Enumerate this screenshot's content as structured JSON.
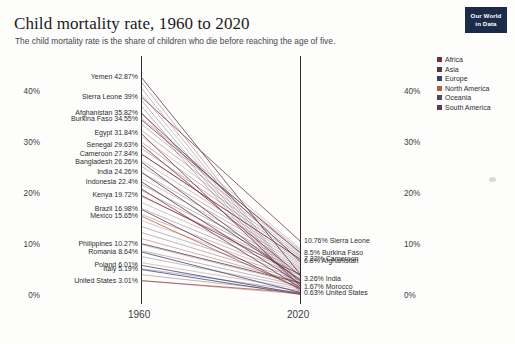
{
  "header": {
    "title": "Child mortality rate, 1960 to 2020",
    "subtitle": "The child mortality rate is the share of children who die before reaching the age of five."
  },
  "logo": {
    "line1": "Our World",
    "line2": "in Data"
  },
  "axes": {
    "y_ticks": [
      "40%",
      "30%",
      "20%",
      "10%",
      "0%"
    ],
    "x_ticks": [
      "1960",
      "2020"
    ]
  },
  "legend": {
    "items": [
      {
        "label": "Africa",
        "color": "#7a2c3a"
      },
      {
        "label": "Asia",
        "color": "#5b3242"
      },
      {
        "label": "Europe",
        "color": "#3b3f6e"
      },
      {
        "label": "North America",
        "color": "#b4594a"
      },
      {
        "label": "Oceania",
        "color": "#4a4a66"
      },
      {
        "label": "South America",
        "color": "#6e3550"
      }
    ]
  },
  "left_labels": [
    {
      "text": "Yemen 42.87%",
      "value": 42.87
    },
    {
      "text": "Sierra Leone 39%",
      "value": 39.0
    },
    {
      "text": "Afghanistan 35.82%",
      "value": 35.82
    },
    {
      "text": "Burkina Faso 34.55%",
      "value": 34.55
    },
    {
      "text": "Egypt 31.84%",
      "value": 31.84
    },
    {
      "text": "Senegal 29.63%",
      "value": 29.63
    },
    {
      "text": "Cameroon 27.84%",
      "value": 27.84
    },
    {
      "text": "Bangladesh 26.26%",
      "value": 26.26
    },
    {
      "text": "India 24.26%",
      "value": 24.26
    },
    {
      "text": "Indonesia 22.4%",
      "value": 22.4
    },
    {
      "text": "Kenya 19.72%",
      "value": 19.72
    },
    {
      "text": "Brazil 16.98%",
      "value": 16.98
    },
    {
      "text": "Mexico 15.65%",
      "value": 15.65
    },
    {
      "text": "Philippines 10.27%",
      "value": 10.27
    },
    {
      "text": "Romania 8.64%",
      "value": 8.64
    },
    {
      "text": "Poland 6.01%",
      "value": 6.01
    },
    {
      "text": "Italy 5.19%",
      "value": 5.19
    },
    {
      "text": "United States 3.01%",
      "value": 3.01
    }
  ],
  "right_labels": [
    {
      "text": "10.76% Sierra Leone",
      "value": 10.76
    },
    {
      "text": "8.5% Burkina Faso",
      "value": 8.5
    },
    {
      "text": "7.22% Cameroon",
      "value": 7.22
    },
    {
      "text": "6.8% Afghanistan",
      "value": 6.8
    },
    {
      "text": "3.26% India",
      "value": 3.26
    },
    {
      "text": "1.67% Morocco",
      "value": 1.67
    },
    {
      "text": "0.63% United States",
      "value": 0.63
    }
  ],
  "chart_data": {
    "type": "line",
    "title": "Child mortality rate, 1960 to 2020",
    "subtitle": "The child mortality rate is the share of children who die before reaching the age of five.",
    "xlabel": "",
    "ylabel": "",
    "x": [
      1960,
      2020
    ],
    "ylim": [
      0,
      45
    ],
    "xlim": [
      1960,
      2020
    ],
    "grid": false,
    "legend_position": "right",
    "y_ticks": [
      0,
      10,
      20,
      30,
      40
    ],
    "series": [
      {
        "name": "Yemen",
        "region": "Asia",
        "values": [
          42.87,
          4.3
        ],
        "color": "#5b3242"
      },
      {
        "name": "Sierra Leone",
        "region": "Africa",
        "values": [
          39.0,
          10.76
        ],
        "color": "#7a2c3a"
      },
      {
        "name": "Afghanistan",
        "region": "Asia",
        "values": [
          35.82,
          6.8
        ],
        "color": "#5b3242"
      },
      {
        "name": "Burkina Faso",
        "region": "Africa",
        "values": [
          34.55,
          8.5
        ],
        "color": "#7a2c3a"
      },
      {
        "name": "Egypt",
        "region": "Africa",
        "values": [
          31.84,
          2.0
        ],
        "color": "#7a2c3a"
      },
      {
        "name": "Senegal",
        "region": "Africa",
        "values": [
          29.63,
          4.0
        ],
        "color": "#7a2c3a"
      },
      {
        "name": "Cameroon",
        "region": "Africa",
        "values": [
          27.84,
          7.22
        ],
        "color": "#7a2c3a"
      },
      {
        "name": "Bangladesh",
        "region": "Asia",
        "values": [
          26.26,
          3.0
        ],
        "color": "#5b3242"
      },
      {
        "name": "India",
        "region": "Asia",
        "values": [
          24.26,
          3.26
        ],
        "color": "#5b3242"
      },
      {
        "name": "Indonesia",
        "region": "Asia",
        "values": [
          22.4,
          2.4
        ],
        "color": "#5b3242"
      },
      {
        "name": "Kenya",
        "region": "Africa",
        "values": [
          19.72,
          4.2
        ],
        "color": "#7a2c3a"
      },
      {
        "name": "Brazil",
        "region": "South America",
        "values": [
          16.98,
          1.4
        ],
        "color": "#6e3550"
      },
      {
        "name": "Mexico",
        "region": "North America",
        "values": [
          15.65,
          1.4
        ],
        "color": "#b4594a"
      },
      {
        "name": "Morocco",
        "region": "Africa",
        "values": [
          21.0,
          1.67
        ],
        "color": "#7a2c3a"
      },
      {
        "name": "Philippines",
        "region": "Asia",
        "values": [
          10.27,
          2.6
        ],
        "color": "#5b3242"
      },
      {
        "name": "Romania",
        "region": "Europe",
        "values": [
          8.64,
          0.7
        ],
        "color": "#3b3f6e"
      },
      {
        "name": "Poland",
        "region": "Europe",
        "values": [
          6.01,
          0.45
        ],
        "color": "#3b3f6e"
      },
      {
        "name": "Italy",
        "region": "Europe",
        "values": [
          5.19,
          0.32
        ],
        "color": "#3b3f6e"
      },
      {
        "name": "United States",
        "region": "North America",
        "values": [
          3.01,
          0.63
        ],
        "color": "#b4594a"
      }
    ]
  }
}
